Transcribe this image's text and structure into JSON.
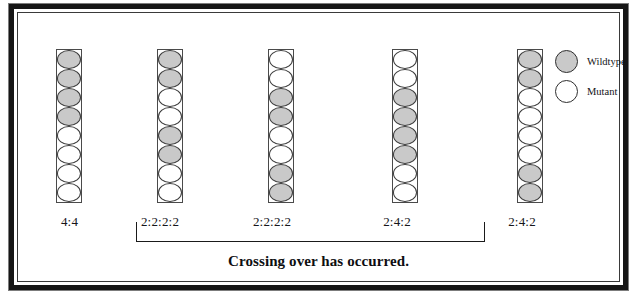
{
  "figure": {
    "caption": "Crossing over has occurred.",
    "legend": {
      "items": [
        {
          "label": "Wildtype",
          "icon": "filled-circle-icon",
          "color": "#c9c9c9"
        },
        {
          "label": "Mutant",
          "icon": "open-circle-icon",
          "color": "#ffffff"
        }
      ]
    },
    "spore_types": {
      "wildtype": "wildtype",
      "mutant": "mutant"
    },
    "asci": [
      {
        "id": "ascus-1",
        "ratio_label": "4:4",
        "spores": [
          "wildtype",
          "wildtype",
          "wildtype",
          "wildtype",
          "mutant",
          "mutant",
          "mutant",
          "mutant"
        ]
      },
      {
        "id": "ascus-2",
        "ratio_label": "2:2:2:2",
        "spores": [
          "wildtype",
          "wildtype",
          "mutant",
          "mutant",
          "wildtype",
          "wildtype",
          "mutant",
          "mutant"
        ]
      },
      {
        "id": "ascus-3",
        "ratio_label": "2:2:2:2",
        "spores": [
          "mutant",
          "mutant",
          "wildtype",
          "wildtype",
          "mutant",
          "mutant",
          "wildtype",
          "wildtype"
        ]
      },
      {
        "id": "ascus-4",
        "ratio_label": "2:4:2",
        "spores": [
          "mutant",
          "mutant",
          "wildtype",
          "wildtype",
          "wildtype",
          "wildtype",
          "mutant",
          "mutant"
        ]
      },
      {
        "id": "ascus-5",
        "ratio_label": "2:4:2",
        "spores": [
          "wildtype",
          "wildtype",
          "mutant",
          "mutant",
          "mutant",
          "mutant",
          "wildtype",
          "wildtype"
        ]
      }
    ],
    "bracket": {
      "covers": [
        "ascus-2",
        "ascus-3",
        "ascus-4",
        "ascus-5"
      ],
      "annotation": "Crossing over has occurred."
    }
  },
  "layout": {
    "column_x": [
      44,
      145,
      256,
      380,
      505
    ],
    "column_top": 42,
    "label_y": 207,
    "label_x": [
      35,
      118,
      230,
      355,
      480
    ],
    "label_width": [
      45,
      60,
      60,
      60,
      60
    ]
  }
}
